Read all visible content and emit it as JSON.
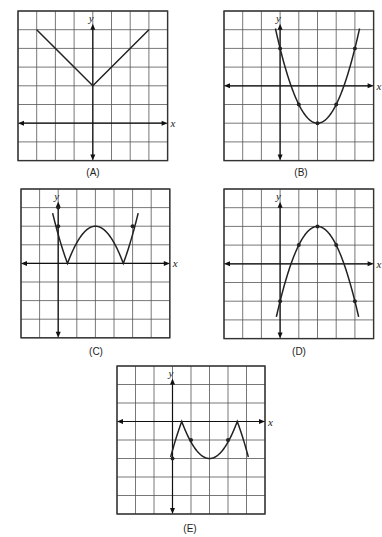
{
  "chart_data": [
    {
      "type": "line",
      "id": "A",
      "title": "(A)",
      "xlabel": "x",
      "ylabel": "y",
      "grid": true,
      "xlim": [
        -4,
        4
      ],
      "ylim": [
        -2,
        6
      ],
      "shape": "absolute value V",
      "points": [
        [
          -3,
          5
        ],
        [
          0,
          2
        ],
        [
          3,
          5
        ]
      ],
      "marked_points": []
    },
    {
      "type": "line",
      "id": "B",
      "title": "(B)",
      "xlabel": "x",
      "ylabel": "y",
      "grid": true,
      "xlim": [
        -3,
        5
      ],
      "ylim": [
        -4,
        4
      ],
      "shape": "upward parabola",
      "points": [
        [
          -0.1,
          2.7
        ],
        [
          0,
          2
        ],
        [
          1,
          -1
        ],
        [
          2,
          -2
        ],
        [
          3,
          -1
        ],
        [
          4,
          2
        ],
        [
          4.1,
          2.7
        ]
      ],
      "marked_points": [
        [
          0,
          2
        ],
        [
          1,
          -1
        ],
        [
          2,
          -2
        ],
        [
          3,
          -1
        ],
        [
          4,
          2
        ]
      ]
    },
    {
      "type": "line",
      "id": "C",
      "title": "(C)",
      "xlabel": "x",
      "ylabel": "y",
      "grid": true,
      "xlim": [
        -2,
        6
      ],
      "ylim": [
        -4,
        4
      ],
      "shape": "absolute value of parabola (W shape)",
      "points": [
        [
          -0.3,
          3.8
        ],
        [
          0,
          2
        ],
        [
          0.5,
          0
        ],
        [
          2,
          2
        ],
        [
          3.5,
          0
        ],
        [
          4,
          2
        ],
        [
          4.3,
          3.8
        ]
      ],
      "marked_points": [
        [
          0,
          2
        ],
        [
          0,
          3
        ],
        [
          4,
          2
        ]
      ]
    },
    {
      "type": "line",
      "id": "D",
      "title": "(D)",
      "xlabel": "x",
      "ylabel": "y",
      "grid": true,
      "xlim": [
        -3,
        5
      ],
      "ylim": [
        -4,
        4
      ],
      "shape": "downward parabola",
      "points": [
        [
          -0.1,
          -2.6
        ],
        [
          0,
          -2
        ],
        [
          1,
          1
        ],
        [
          2,
          2
        ],
        [
          3,
          1
        ],
        [
          4,
          -2
        ],
        [
          4.1,
          -2.6
        ]
      ],
      "marked_points": [
        [
          0,
          -2
        ],
        [
          1,
          1
        ],
        [
          2,
          2
        ],
        [
          3,
          1
        ],
        [
          4,
          -2
        ]
      ]
    },
    {
      "type": "line",
      "id": "E",
      "title": "(E)",
      "xlabel": "x",
      "ylabel": "y",
      "grid": true,
      "xlim": [
        -3,
        5
      ],
      "ylim": [
        -5,
        3
      ],
      "shape": "negative absolute value of parabola (M shape below axis)",
      "points": [
        [
          -0.1,
          -2.6
        ],
        [
          0,
          -2
        ],
        [
          0.5,
          0
        ],
        [
          1,
          -1
        ],
        [
          2,
          -2
        ],
        [
          3,
          -1
        ],
        [
          3.5,
          0
        ],
        [
          4,
          -2
        ],
        [
          4.1,
          -2.6
        ]
      ],
      "marked_points": [
        [
          0,
          -2
        ],
        [
          1,
          -1
        ],
        [
          3,
          -1
        ]
      ]
    }
  ],
  "labels": {
    "A": "(A)",
    "B": "(B)",
    "C": "(C)",
    "D": "(D)",
    "E": "(E)",
    "x_axis": "x",
    "y_axis": "y"
  },
  "colors": {
    "grid": "#555555",
    "curve": "#222222"
  }
}
